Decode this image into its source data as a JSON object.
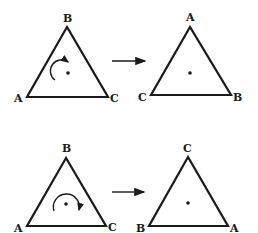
{
  "diagram": {
    "colors": {
      "stroke": "#1a1a1a",
      "background": "#ffffff"
    },
    "rows": [
      {
        "rotation": "counterclockwise-partial",
        "rotation_icon": "curved-arrow-icon",
        "before": {
          "top": "B",
          "left": "A",
          "right": "C"
        },
        "after": {
          "top": "A",
          "left": "C",
          "right": "B"
        }
      },
      {
        "rotation": "clockwise-full",
        "rotation_icon": "circular-arrow-icon",
        "before": {
          "top": "B",
          "left": "A",
          "right": "C"
        },
        "after": {
          "top": "C",
          "left": "B",
          "right": "A"
        }
      }
    ]
  }
}
